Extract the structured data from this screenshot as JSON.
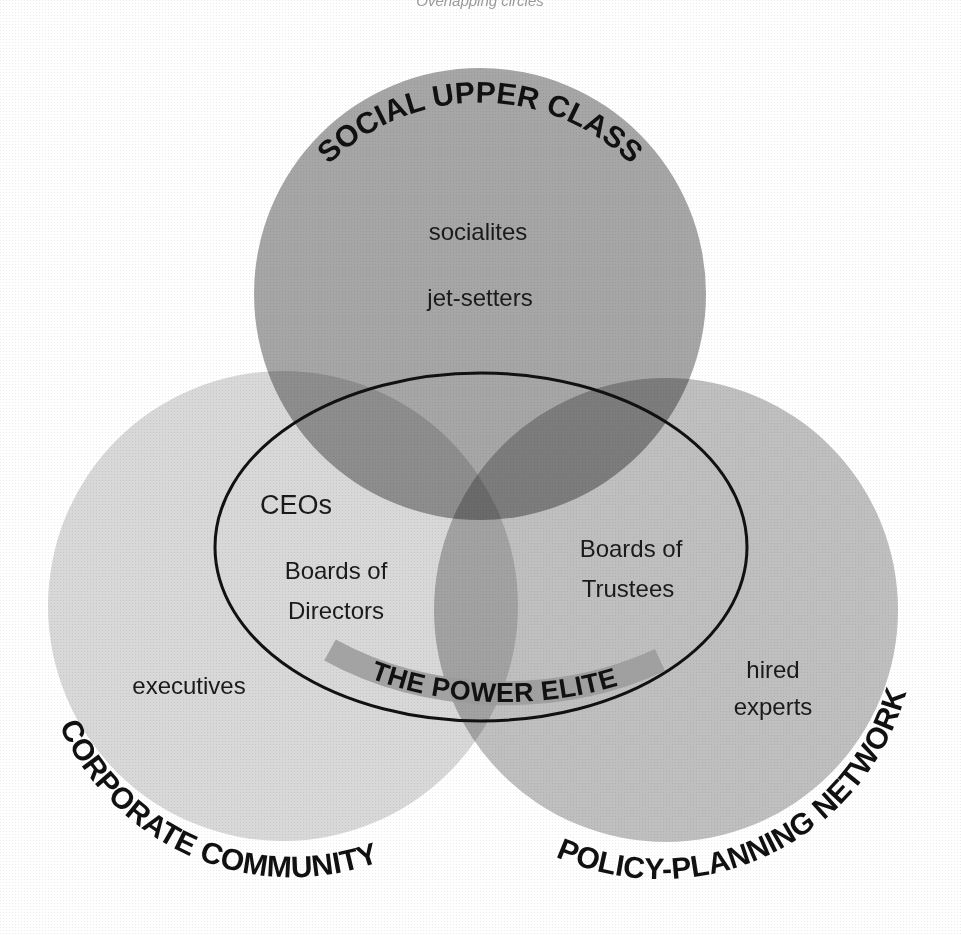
{
  "header": {
    "clipped_caption": "Overlapping circles"
  },
  "colors": {
    "background": "#ffffff",
    "social_upper_class_fill": "#9c9c9c",
    "corporate_community_fill": "#d8d8d8",
    "policy_planning_fill": "#bdbdbd",
    "power_elite_outline": "#111111",
    "power_elite_band": "#9a9a9a",
    "text": "#111111"
  },
  "circles": {
    "social_upper_class": {
      "title": "SOCIAL UPPER CLASS",
      "members": [
        "socialites",
        "jet-setters"
      ]
    },
    "corporate_community": {
      "title": "CORPORATE COMMUNITY",
      "members": [
        "executives"
      ]
    },
    "policy_planning_network": {
      "title": "POLICY-PLANNING NETWORK",
      "members": [
        "hired",
        "experts"
      ]
    }
  },
  "power_elite": {
    "title": "THE POWER ELITE",
    "corporate_side": [
      "CEOs",
      "Boards of",
      "Directors"
    ],
    "policy_side": [
      "Boards of",
      "Trustees"
    ]
  }
}
